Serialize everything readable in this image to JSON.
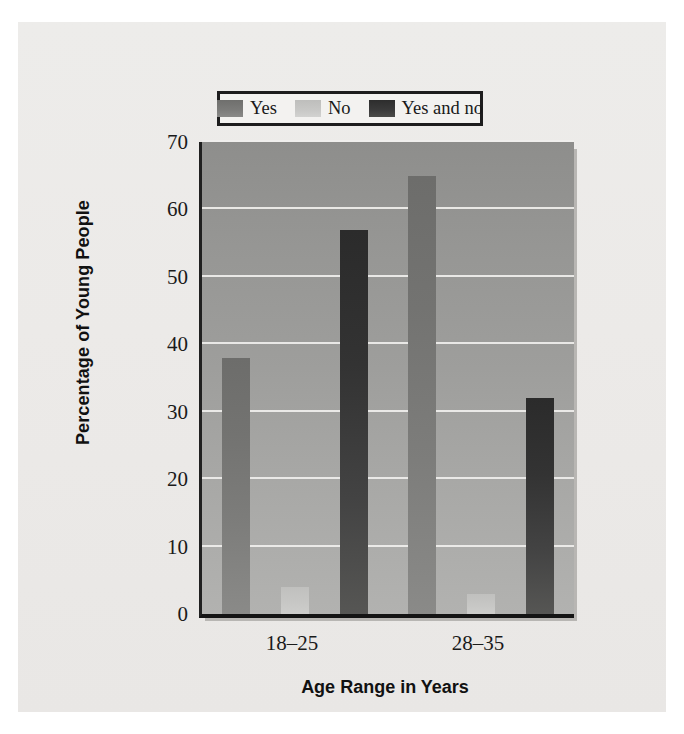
{
  "chart_data": {
    "type": "bar",
    "title": "",
    "xlabel": "Age Range in Years",
    "ylabel": "Percentage of Young People",
    "categories": [
      "18–25",
      "28–35"
    ],
    "series": [
      {
        "name": "Yes",
        "values": [
          38,
          65
        ],
        "color": "#777775"
      },
      {
        "name": "No",
        "values": [
          4,
          3
        ],
        "color": "#c6c6c4"
      },
      {
        "name": "Yes and no",
        "values": [
          57,
          32
        ],
        "color": "#373737"
      }
    ],
    "ylim": [
      0,
      70
    ],
    "yticks": [
      0,
      10,
      20,
      30,
      40,
      50,
      60,
      70
    ],
    "ytick_labels": [
      "0",
      "10",
      "20",
      "30",
      "40",
      "50",
      "60",
      "70"
    ],
    "grid": "horizontal",
    "legend_position": "top-center",
    "legend_entries": [
      "Yes",
      "No",
      "Yes and no"
    ]
  }
}
